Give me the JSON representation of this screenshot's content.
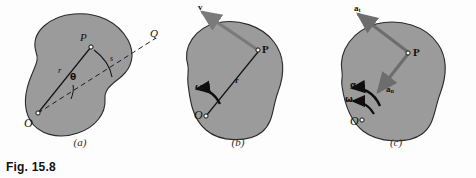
{
  "figure": {
    "caption": "Fig. 15.8",
    "colors": {
      "background": "#fdfdfd",
      "body_fill": "#9b9b9b",
      "body_outline": "#2a2a2a",
      "vector": "#6f6f6f",
      "ink": "#111111"
    }
  },
  "panels": [
    {
      "id": "a",
      "caption": "(a)",
      "description": "Rigid body rotating about O; position of point P defined by r and theta measured from fixed reference line OQ; arc length s.",
      "labels": {
        "center": "O",
        "point": "P",
        "radius": "r",
        "angle": "θ",
        "arc": "s",
        "reference": "Q"
      }
    },
    {
      "id": "b",
      "caption": "(b)",
      "description": "Velocity of P is tangent to its circular path; magnitude v equals r times omega.",
      "labels": {
        "center": "O",
        "point": "P",
        "radius": "r",
        "velocity": "v",
        "angular_velocity": "ω"
      }
    },
    {
      "id": "c",
      "caption": "(c)",
      "description": "Acceleration of P resolved into tangential component a_t and normal component a_n; angular velocity omega and angular acceleration alpha shown at O.",
      "labels": {
        "center": "O",
        "point": "P",
        "tangential": {
          "symbol": "a",
          "subscript": "t"
        },
        "normal": {
          "symbol": "a",
          "subscript": "n"
        },
        "angular_velocity": "ω",
        "angular_acceleration": "α"
      }
    }
  ]
}
